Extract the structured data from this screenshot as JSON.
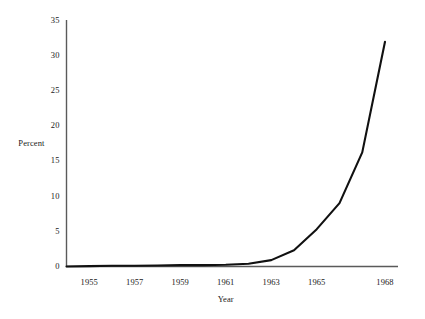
{
  "chart_data": {
    "type": "line",
    "title": "",
    "xlabel": "Year",
    "ylabel": "Percent",
    "xlim": [
      1954,
      1968
    ],
    "ylim": [
      0,
      35
    ],
    "grid": false,
    "legend": false,
    "yticks": [
      0,
      5,
      10,
      15,
      20,
      25,
      30,
      35
    ],
    "ytick_labels": [
      "0",
      "5",
      "10",
      "15",
      "20",
      "25",
      "30",
      "35"
    ],
    "xticks": [
      1955,
      1957,
      1959,
      1961,
      1963,
      1965,
      1968
    ],
    "xtick_labels": [
      "1955",
      "1957",
      "1959",
      "1961",
      "1963",
      "1965",
      "1968"
    ],
    "series": [
      {
        "name": "Percent",
        "color": "#111111",
        "x": [
          1954,
          1955,
          1956,
          1957,
          1958,
          1959,
          1960,
          1961,
          1962,
          1963,
          1964,
          1965,
          1966,
          1967,
          1968
        ],
        "y": [
          0.0,
          0.05,
          0.1,
          0.1,
          0.15,
          0.2,
          0.2,
          0.25,
          0.4,
          0.9,
          2.3,
          5.3,
          9.0,
          16.2,
          31.9
        ]
      }
    ]
  },
  "axis_style": {
    "axis_color": "#5a5a5a",
    "line_color": "#111111",
    "background": "#ffffff"
  }
}
